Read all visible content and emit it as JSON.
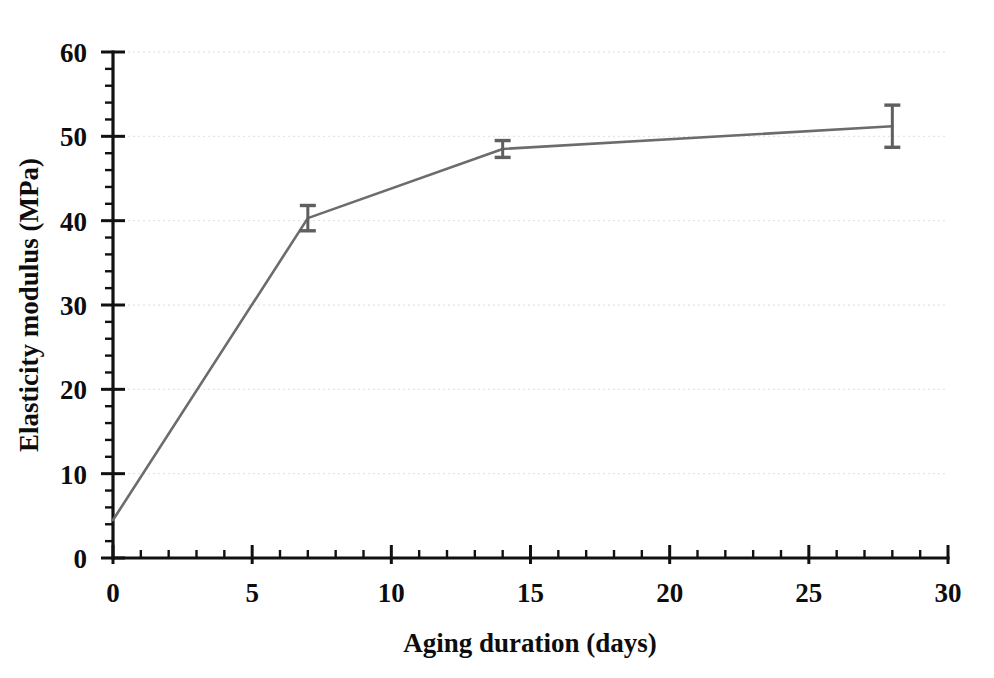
{
  "chart_data": {
    "type": "line",
    "title": "",
    "xlabel": "Aging duration (days)",
    "ylabel": "Elasticity modulus (MPa)",
    "xlim": [
      0,
      30
    ],
    "ylim": [
      0,
      60
    ],
    "x": [
      0,
      7,
      14,
      28
    ],
    "values": [
      4.5,
      40.3,
      48.5,
      51.2
    ],
    "errors": [
      0,
      1.5,
      1.0,
      2.5
    ],
    "series": [
      {
        "name": "Elasticity modulus",
        "x": [
          0,
          7,
          14,
          28
        ],
        "values": [
          4.5,
          40.3,
          48.5,
          51.2
        ],
        "errors": [
          0,
          1.5,
          1.0,
          2.5
        ]
      }
    ],
    "xticks": [
      0,
      5,
      10,
      15,
      20,
      25,
      30
    ],
    "yticks": [
      0,
      10,
      20,
      30,
      40,
      50,
      60
    ],
    "xtick_labels": [
      "0",
      "5",
      "10",
      "15",
      "20",
      "25",
      "30"
    ],
    "ytick_labels": [
      "0",
      "10",
      "20",
      "30",
      "40",
      "50",
      "60"
    ],
    "x_minor_step": 1,
    "y_minor_step": 2,
    "grid": true,
    "grid_axis": "y",
    "legend": false,
    "legend_position": "none",
    "line_color": "#6c6c6c",
    "error_color": "#5f5f5f",
    "axis_color": "#111111",
    "grid_color": "#d8d8d8",
    "background_color": "#ffffff"
  }
}
